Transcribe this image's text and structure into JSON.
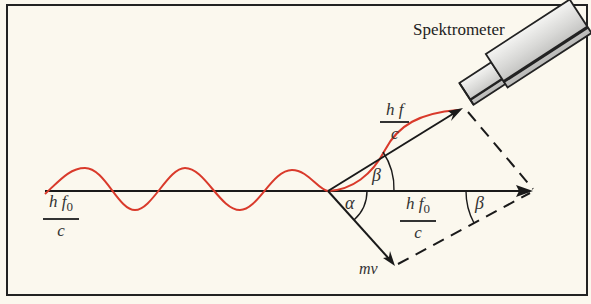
{
  "figure": {
    "title_label": "Spektrometer",
    "labels": {
      "incident_momentum": {
        "num_h": "h",
        "num_f": "f",
        "sub": "0",
        "den": "c"
      },
      "incident_momentum_right": {
        "num_h": "h",
        "num_f": "f",
        "sub": "0",
        "den": "c"
      },
      "scattered_momentum": {
        "num_h": "h",
        "num_f": "f",
        "den": "c"
      },
      "electron_momentum": "mv",
      "angle_alpha": "α",
      "angle_beta_top": "β",
      "angle_beta_right": "β"
    },
    "colors": {
      "wave": "#d93a2b",
      "lines": "#1a1a1a",
      "background": "#fbf8ee",
      "border": "#222222"
    }
  }
}
